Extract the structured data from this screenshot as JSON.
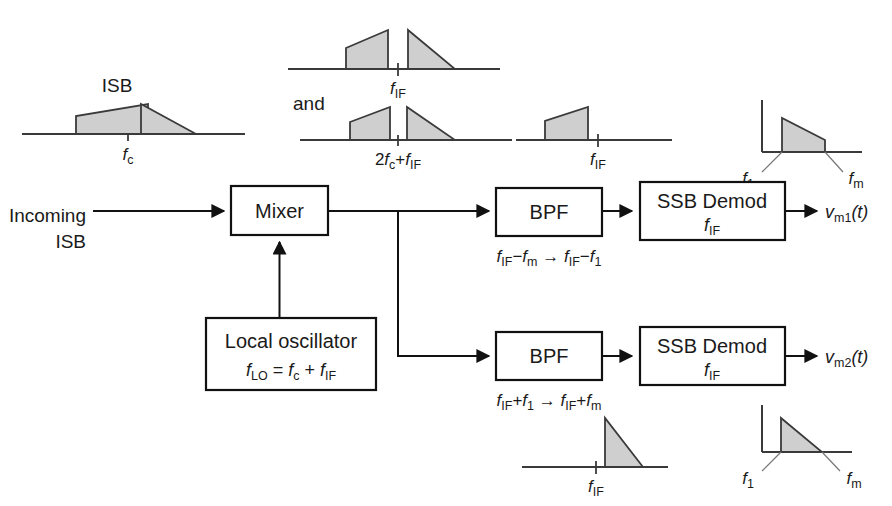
{
  "diagram": {
    "colors": {
      "line": "#111111",
      "spectrum_fill": "#cfcfcf",
      "spectrum_stroke": "#3a3a3a",
      "background": "#ffffff"
    }
  },
  "blocks": {
    "mixer": {
      "label": "Mixer"
    },
    "local_oscillator": {
      "label": "Local oscillator",
      "formula_main": "f",
      "formula_sub": "LO",
      "formula_rest": " = f",
      "formula_sub2": "c",
      "formula_rest2": " + f",
      "formula_sub3": "IF",
      "formula_text": "fLO = fc + fIF"
    },
    "bpf_top": {
      "label": "BPF",
      "range_text": "fIF−fm → fIF−f1"
    },
    "bpf_bottom": {
      "label": "BPF",
      "range_text": "fIF+f1 → fIF+fm"
    },
    "ssb_demod_top": {
      "label_line1": "SSB  Demod",
      "label_line2": "fIF"
    },
    "ssb_demod_bottom": {
      "label_line1": "SSB  Demod",
      "label_line2": "fIF"
    }
  },
  "labels": {
    "incoming_line1": "Incoming",
    "incoming_line2": "ISB",
    "and": "and",
    "output_top": "vm1(t)",
    "output_bottom": "vm2(t)"
  },
  "spectra": {
    "isb_input": {
      "name": "ISB",
      "tick_label": "fc",
      "description": "two sidebands straddling carrier frequency"
    },
    "if_pair": {
      "tick_label": "fIF",
      "description": "mixer output image pair centered at IF"
    },
    "sum_pair": {
      "tick_label": "2fc+fIF",
      "description": "mixer sum product pair"
    },
    "lsb_if": {
      "tick_label": "fIF",
      "description": "lower sideband selected by top BPF"
    },
    "usb_if": {
      "tick_label": "fIF",
      "description": "upper sideband selected by bottom BPF"
    },
    "baseband_top": {
      "tick_label_low": "f1",
      "tick_label_high": "fm",
      "description": "recovered baseband message 1"
    },
    "baseband_bottom": {
      "tick_label_low": "f1",
      "tick_label_high": "fm",
      "description": "recovered baseband message 2"
    }
  }
}
